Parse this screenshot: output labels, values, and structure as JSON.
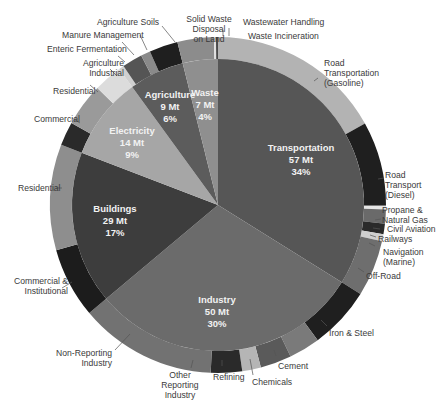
{
  "chart_data": {
    "type": "pie",
    "subtype": "nested-donut",
    "title": "",
    "units": "Mt",
    "sectors": [
      {
        "name": "Transportation",
        "value": 57,
        "percent": "34%",
        "value_label": "57 Mt",
        "color": "#565656",
        "subsectors": [
          {
            "name": "Road Transportation (Gasoline)",
            "share": 0.5,
            "color": "#b3b3b3"
          },
          {
            "name": "Road Transport (Diesel)",
            "share": 0.24,
            "color": "#1f1f1f"
          },
          {
            "name": "Propane & Natural Gas",
            "share": 0.01,
            "color": "#e6e6e6"
          },
          {
            "name": "Civil Aviation",
            "share": 0.04,
            "color": "#6a6a6a"
          },
          {
            "name": "Railways",
            "share": 0.03,
            "color": "#2a2a2a"
          },
          {
            "name": "Navigation (Marine)",
            "share": 0.02,
            "color": "#cfcfcf"
          },
          {
            "name": "Off-Road",
            "share": 0.16,
            "color": "#6e6e6e"
          }
        ]
      },
      {
        "name": "Industry",
        "value": 50,
        "percent": "30%",
        "value_label": "50 Mt",
        "color": "#6b6b6b",
        "subsectors": [
          {
            "name": "Iron & Steel",
            "share": 0.2,
            "color": "#1f1f1f"
          },
          {
            "name": "Cement",
            "share": 0.1,
            "color": "#7a7a7a"
          },
          {
            "name": "Chemicals",
            "share": 0.1,
            "color": "#5a5a5a"
          },
          {
            "name": "Refining",
            "share": 0.06,
            "color": "#b5b5b5"
          },
          {
            "name": "Other Reporting Industry",
            "share": 0.1,
            "color": "#2a2a2a"
          },
          {
            "name": "Non-Reporting Industry",
            "share": 0.44,
            "color": "#727272"
          }
        ]
      },
      {
        "name": "Buildings",
        "value": 29,
        "percent": "17%",
        "value_label": "29 Mt",
        "color": "#3d3d3d",
        "subsectors": [
          {
            "name": "Commercial & Institutional",
            "share": 0.4,
            "color": "#1c1c1c"
          },
          {
            "name": "Residential",
            "share": 0.6,
            "color": "#8e8e8e"
          }
        ]
      },
      {
        "name": "Electricity",
        "value": 14,
        "percent": "9%",
        "value_label": "14 Mt",
        "color": "#a6a6a6",
        "subsectors": [
          {
            "name": "Commercial",
            "share": 0.25,
            "color": "#2a2a2a"
          },
          {
            "name": "Residential",
            "share": 0.45,
            "color": "#9a9a9a"
          },
          {
            "name": "Industrial",
            "share": 0.3,
            "color": "#dcdcdc"
          }
        ]
      },
      {
        "name": "Agriculture",
        "value": 9,
        "percent": "6%",
        "value_label": "9 Mt",
        "color": "#5c5c5c",
        "subsectors": [
          {
            "name": "Agriculture",
            "share": 0.08,
            "color": "#d0d0d0"
          },
          {
            "name": "Enteric Fermentation",
            "share": 0.32,
            "color": "#555555"
          },
          {
            "name": "Manure Management",
            "share": 0.15,
            "color": "#8a8a8a"
          },
          {
            "name": "Agriculture Soils",
            "share": 0.45,
            "color": "#1f1f1f"
          }
        ]
      },
      {
        "name": "Waste",
        "value": 7,
        "percent": "4%",
        "value_label": "7 Mt",
        "color": "#8f8f8f",
        "subsectors": [
          {
            "name": "Solid Waste Disposal on Land",
            "share": 0.9,
            "color": "#8c8c8c"
          },
          {
            "name": "Waste Incineration",
            "share": 0.05,
            "color": "#e0e0e0"
          },
          {
            "name": "Wastewater Handling",
            "share": 0.05,
            "color": "#4a4a4a"
          }
        ]
      }
    ],
    "geometry": {
      "cx": 218,
      "cy": 205,
      "r_outer": 168,
      "r_inner": 146,
      "start_deg": 0,
      "sector_angles": [
        122,
        108,
        61,
        33,
        22,
        14
      ]
    },
    "legend": "none (callout labels)"
  },
  "inner_labels": [
    {
      "name": "Transportation",
      "value": "57 Mt",
      "pct": "34%",
      "x": 301,
      "y": 142
    },
    {
      "name": "Industry",
      "value": "50 Mt",
      "pct": "30%",
      "x": 217,
      "y": 295
    },
    {
      "name": "Buildings",
      "value": "29 Mt",
      "pct": "17%",
      "x": 116,
      "y": 203
    },
    {
      "name": "Electricity",
      "value": "14 Mt",
      "pct": "9%",
      "x": 133,
      "y": 126
    },
    {
      "name": "Agriculture",
      "value": "9 Mt",
      "pct": "6%",
      "x": 170,
      "y": 90
    },
    {
      "name": "Waste",
      "value": "7 Mt",
      "pct": "4%",
      "x": 205,
      "y": 88
    }
  ],
  "callouts": {
    "agri_soils": "Agriculture Soils",
    "manure": "Manure Management",
    "enteric": "Enteric Fermentation",
    "agri_1": "Agriculture",
    "agri_2": "Industrial",
    "elec_res": "Residential",
    "elec_com": "Commercial",
    "bld_res": "Residential",
    "bld_com_1": "Commercial &",
    "bld_com_2": "Institutional",
    "nonrep_1": "Non-Reporting",
    "nonrep_2": "Industry",
    "other_1": "Other",
    "other_2": "Reporting",
    "other_3": "Industry",
    "refining": "Refining",
    "chemicals": "Chemicals",
    "cement": "Cement",
    "iron": "Iron & Steel",
    "offroad": "Off-Road",
    "nav_1": "Navigation",
    "nav_2": "(Marine)",
    "railways": "Railways",
    "aviation": "Civil Aviation",
    "propane_1": "Propane &",
    "propane_2": "Natural Gas",
    "diesel_1": "Road",
    "diesel_2": "Transport",
    "diesel_3": "(Diesel)",
    "gas_1": "Road",
    "gas_2": "Transportation",
    "gas_3": "(Gasoline)",
    "swd_1": "Solid Waste",
    "swd_2": "Disposal",
    "swd_3": "on Land",
    "wastewater": "Wastewater Handling",
    "incineration": "Waste Incineration"
  }
}
